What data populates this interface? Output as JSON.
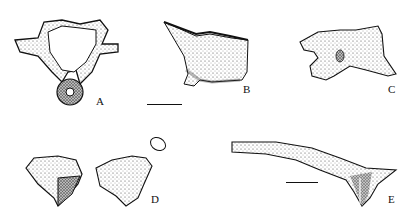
{
  "figure": {
    "panels": [
      {
        "id": "A",
        "label": "A",
        "subject": "vertebra-ring-anterior-view"
      },
      {
        "id": "B",
        "label": "B",
        "subject": "bone-fragment-lateral-view"
      },
      {
        "id": "C",
        "label": "C",
        "subject": "bone-fragment-process"
      },
      {
        "id": "D",
        "label": "D",
        "subject": "paired-bone-fragments-with-cross-section"
      },
      {
        "id": "E",
        "label": "E",
        "subject": "elongate-bone-rib-like"
      }
    ],
    "scale_bars": [
      {
        "panel": "B",
        "x1": 147,
        "x2": 182,
        "y": 104
      },
      {
        "panel": "E",
        "x1": 286,
        "x2": 318,
        "y": 182
      }
    ],
    "colors": {
      "ink": "#111111",
      "paper": "#ffffff",
      "stipple": "#555555"
    }
  }
}
